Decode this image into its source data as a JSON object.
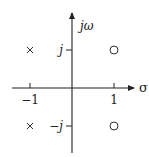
{
  "diagram": {
    "type": "pole-zero-plot",
    "axes": {
      "horizontal_label": "σ",
      "vertical_label": "jω",
      "horizontal_ticks": [
        {
          "value": -1,
          "label": "−1"
        },
        {
          "value": 1,
          "label": "1"
        }
      ],
      "vertical_ticks": [
        {
          "value": 1,
          "label": "j"
        },
        {
          "value": -1,
          "label": "−j"
        }
      ]
    },
    "poles": [
      {
        "re": -1,
        "im": 1,
        "marker": "×"
      },
      {
        "re": -1,
        "im": -1,
        "marker": "×"
      }
    ],
    "zeros": [
      {
        "re": 1,
        "im": 1,
        "marker": "○"
      },
      {
        "re": 1,
        "im": -1,
        "marker": "○"
      }
    ],
    "colors": {
      "axis": "#222222",
      "marker": "#333333"
    }
  }
}
